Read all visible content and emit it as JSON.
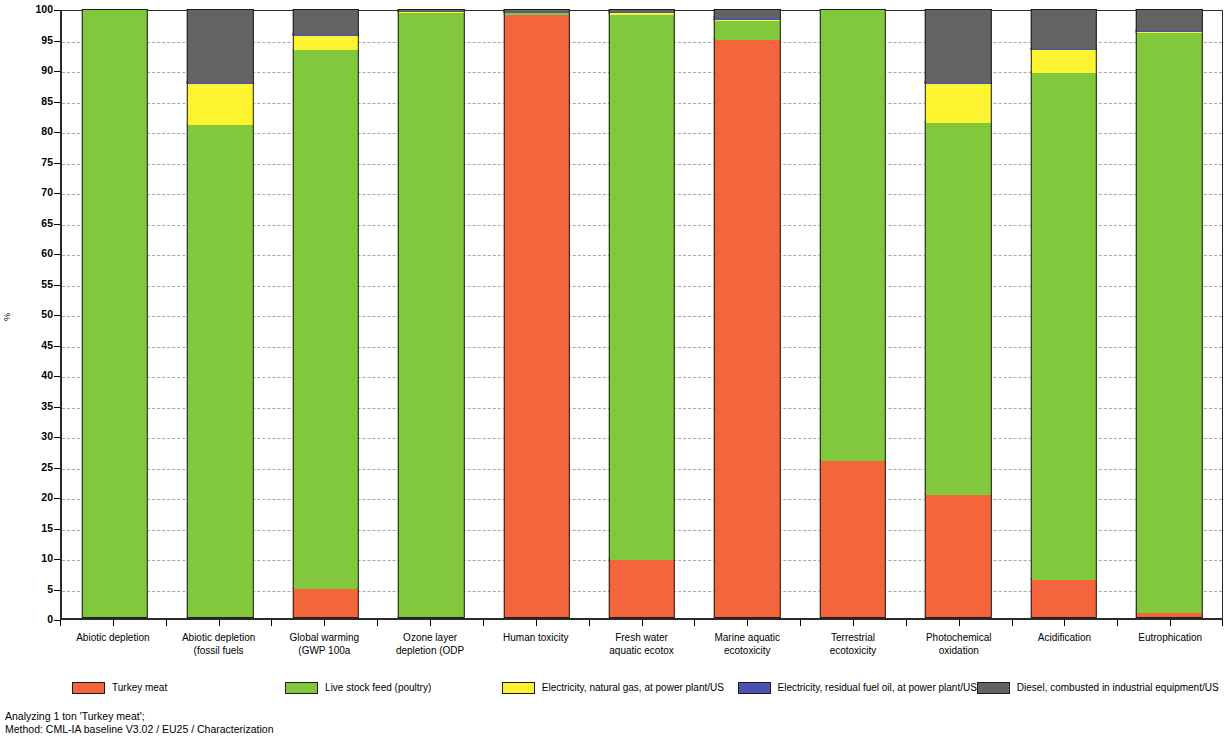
{
  "chart_data": {
    "type": "bar",
    "subtype": "stacked-percentage",
    "title": "",
    "xlabel": "",
    "ylabel": "%",
    "ylim": [
      0,
      100
    ],
    "ytick_step": 5,
    "yticks": [
      100,
      95,
      90,
      85,
      80,
      75,
      70,
      65,
      60,
      55,
      50,
      45,
      40,
      35,
      30,
      25,
      20,
      15,
      10,
      5,
      0
    ],
    "grid": true,
    "legend_position": "bottom",
    "categories": [
      "Abiotic depletion",
      "Abiotic depletion (fossil fuels",
      "Global warming (GWP100a",
      "Ozone layer depletion (ODP",
      "Human toxicity",
      "Fresh water aquatic ecotox",
      "Marine aquatic ecotoxicity",
      "Terrestrial ecotoxicity",
      "Photochemical oxidation",
      "Acidification",
      "Eutrophication"
    ],
    "category_lines": [
      [
        "Abiotic depletion",
        ""
      ],
      [
        "Abiotic depletion",
        "(fossil fuels"
      ],
      [
        "Global warming",
        "(GWP 100a"
      ],
      [
        "Ozone layer",
        "depletion (ODP"
      ],
      [
        "Human toxicity",
        ""
      ],
      [
        "Fresh water",
        "aquatic ecotox"
      ],
      [
        "Marine aquatic",
        "ecotoxicity"
      ],
      [
        "Terrestrial",
        "ecotoxicity"
      ],
      [
        "Photochemical",
        "oxidation"
      ],
      [
        "Acidification",
        ""
      ],
      [
        "Eutrophication",
        ""
      ]
    ],
    "series": [
      {
        "name": "Turkey meat",
        "color": "#F4653C",
        "values": [
          0,
          0,
          4.8,
          0.1,
          99.3,
          9.5,
          95.3,
          25.8,
          20.3,
          6.3,
          0.8
        ]
      },
      {
        "name": "Live stock feed (poultry)",
        "color": "#82C83C",
        "values": [
          100,
          81.3,
          88.7,
          99.6,
          0.3,
          89.9,
          3.0,
          74.2,
          61.3,
          83.5,
          95.5
        ]
      },
      {
        "name": "Electricity, natural gas, at power plant/US",
        "color": "#FCF430",
        "values": [
          0,
          6.7,
          2.4,
          0.1,
          0.1,
          0.2,
          0.2,
          0,
          6.4,
          3.7,
          0.2
        ]
      },
      {
        "name": "Electricity, residual fuel oil, at power plant/US",
        "color": "#4B51B5",
        "values": [
          0,
          0.2,
          0.2,
          0.1,
          0.1,
          0.2,
          0.4,
          0,
          0.2,
          0.2,
          0.2
        ]
      },
      {
        "name": "Diesel, combusted in industrial equipment/US",
        "color": "#636363",
        "values": [
          0,
          11.8,
          3.9,
          0.1,
          0.2,
          0.2,
          1.1,
          0,
          11.8,
          6.3,
          3.3
        ]
      }
    ]
  },
  "footer": {
    "line1": "Analyzing 1 ton 'Turkey meat';",
    "line2": "Method: CML-IA baseline V3.02 / EU25 / Characterization"
  }
}
